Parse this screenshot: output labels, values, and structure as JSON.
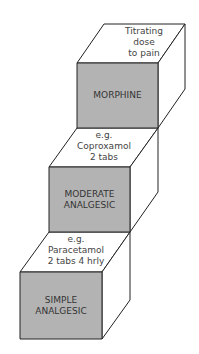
{
  "diagram": {
    "type": "analgesic-ladder-stacked-cubes",
    "colors": {
      "front_face": "#b3b3b3",
      "top_face": "#ffffff",
      "side_face": "#ffffff",
      "stroke": "#222222",
      "text": "#333333"
    },
    "steps": [
      {
        "level": 3,
        "front_label_line1": "MORPHINE",
        "front_label_line2": "",
        "top_label_line1": "Titrating",
        "top_label_line2": "dose",
        "top_label_line3": "to pain"
      },
      {
        "level": 2,
        "front_label_line1": "MODERATE",
        "front_label_line2": "ANALGESIC",
        "top_label_line1": "e.g.",
        "top_label_line2": "Coproxamol",
        "top_label_line3": "2 tabs"
      },
      {
        "level": 1,
        "front_label_line1": "SIMPLE",
        "front_label_line2": "ANALGESIC",
        "top_label_line1": "e.g.",
        "top_label_line2": "Paracetamol",
        "top_label_line3": "2 tabs 4 hrly"
      }
    ]
  }
}
